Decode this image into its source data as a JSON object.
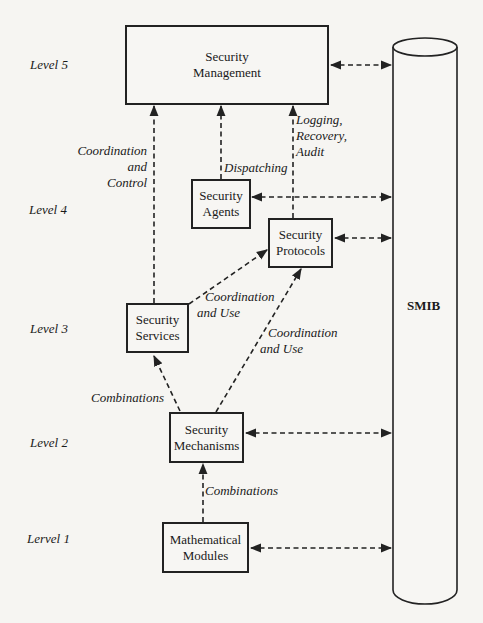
{
  "diagram": {
    "type": "layered-architecture",
    "levels": [
      {
        "id": "level5",
        "label": "Level 5"
      },
      {
        "id": "level4",
        "label": "Level 4"
      },
      {
        "id": "level3",
        "label": "Level 3"
      },
      {
        "id": "level2",
        "label": "Level 2"
      },
      {
        "id": "level1",
        "label": "Lervel 1"
      }
    ],
    "nodes": {
      "management": {
        "line1": "Security",
        "line2": "Management",
        "level": 5
      },
      "agents": {
        "line1": "Security",
        "line2": "Agents",
        "level": 4
      },
      "protocols": {
        "line1": "Security",
        "line2": "Protocols",
        "level": 4
      },
      "services": {
        "line1": "Security",
        "line2": "Services",
        "level": 3
      },
      "mechanisms": {
        "line1": "Security",
        "line2": "Mechanisms",
        "level": 2
      },
      "modules": {
        "line1": "Mathematical",
        "line2": "Modules",
        "level": 1
      }
    },
    "store": {
      "label": "SMIB",
      "shape": "cylinder"
    },
    "edge_labels": {
      "coord_control": {
        "line1": "Coordination",
        "line2": "and",
        "line3": "Control"
      },
      "dispatching": "Dispatching",
      "logging": {
        "line1": "Logging,",
        "line2": "Recovery,",
        "line3": "Audit"
      },
      "coord_use_services": {
        "line1": "Coordination",
        "line2": "and Use"
      },
      "coord_use_mechanisms": {
        "line1": "Coordination",
        "line2": "and Use"
      },
      "combinations_services": "Combinations",
      "combinations_modules": "Combinations"
    },
    "edges": [
      {
        "from": "services",
        "to": "management",
        "label": "Coordination and Control",
        "style": "dashed"
      },
      {
        "from": "agents",
        "to": "management",
        "label": "Dispatching",
        "style": "dashed"
      },
      {
        "from": "protocols",
        "to": "management",
        "label": "Logging, Recovery, Audit",
        "style": "dashed"
      },
      {
        "from": "services",
        "to": "protocols",
        "label": "Coordination and Use",
        "style": "dashed"
      },
      {
        "from": "mechanisms",
        "to": "protocols",
        "label": "Coordination and Use",
        "style": "dashed"
      },
      {
        "from": "mechanisms",
        "to": "services",
        "label": "Combinations",
        "style": "dashed"
      },
      {
        "from": "modules",
        "to": "mechanisms",
        "label": "Combinations",
        "style": "dashed"
      },
      {
        "from": "management",
        "to": "SMIB",
        "style": "dashed-bidirectional"
      },
      {
        "from": "agents",
        "to": "SMIB",
        "style": "dashed-bidirectional"
      },
      {
        "from": "protocols",
        "to": "SMIB",
        "style": "dashed-bidirectional"
      },
      {
        "from": "mechanisms",
        "to": "SMIB",
        "style": "dashed-bidirectional"
      },
      {
        "from": "modules",
        "to": "SMIB",
        "style": "dashed-bidirectional"
      }
    ]
  }
}
